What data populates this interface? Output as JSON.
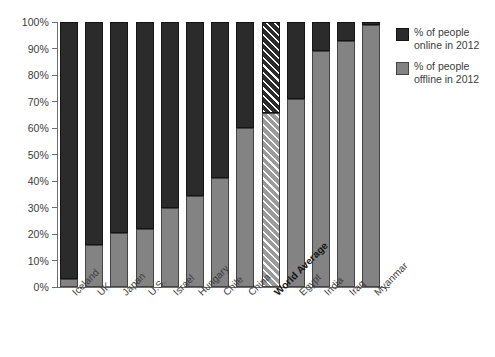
{
  "chart_data": {
    "type": "bar",
    "stacked": true,
    "title": "",
    "subtitle": "",
    "xlabel": "",
    "ylabel": "",
    "ylim": [
      0,
      100
    ],
    "ytick_labels": [
      "100%",
      "90%",
      "80%",
      "70%",
      "60%",
      "50%",
      "40%",
      "30%",
      "20%",
      "10%",
      "0%"
    ],
    "ytick_values": [
      100,
      90,
      80,
      70,
      60,
      50,
      40,
      30,
      20,
      10,
      0
    ],
    "grid": false,
    "legend_position": "right",
    "categories": [
      "Iceland",
      "UK",
      "Japan",
      "U.S.",
      "Israel",
      "Hungary",
      "Chile",
      "China",
      "World Average",
      "Egypt",
      "India",
      "Iraq",
      "Myanmar"
    ],
    "emphasized_category": "World Average",
    "series": [
      {
        "name": "% of people\noffline in 2012",
        "color": "#838383",
        "values": [
          3,
          16,
          20.5,
          22,
          30,
          34.5,
          41,
          60,
          65.5,
          71,
          89,
          93,
          99
        ]
      },
      {
        "name": "% of people\nonline in 2012",
        "color": "#2b2b2b",
        "values": [
          97,
          84,
          79.5,
          78,
          70,
          65.5,
          59,
          40,
          34.5,
          29,
          11,
          7,
          1
        ]
      }
    ]
  },
  "legend": {
    "items": [
      {
        "label": "% of people\nonline in 2012",
        "swatch": "online"
      },
      {
        "label": "% of people\noffline in 2012",
        "swatch": "offline"
      }
    ]
  },
  "colors": {
    "online": "#2b2b2b",
    "offline": "#838383",
    "axis": "#6e6e6e",
    "text": "#3c3c3c",
    "background": "#ffffff"
  }
}
